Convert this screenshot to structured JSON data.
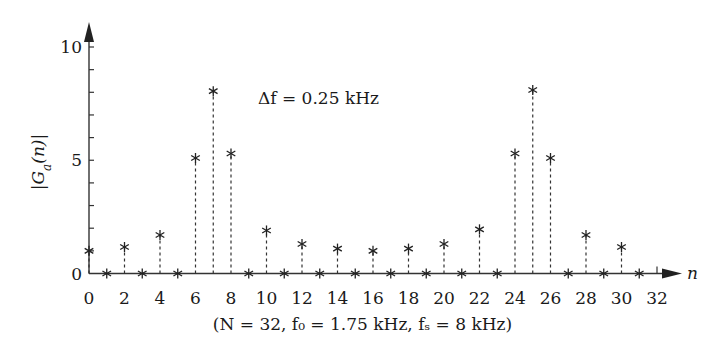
{
  "chart_data": {
    "type": "scatter",
    "style": "stem",
    "title": "",
    "xlabel": "n",
    "ylabel": "|G_a(n)|",
    "xlim": [
      0,
      32
    ],
    "ylim": [
      0,
      10
    ],
    "xticks": [
      0,
      2,
      4,
      6,
      8,
      10,
      12,
      14,
      16,
      18,
      20,
      22,
      24,
      26,
      28,
      30,
      32
    ],
    "yticks_labeled": [
      0,
      5,
      10
    ],
    "yticks_minor": [
      1,
      2,
      3,
      4,
      6,
      7,
      8,
      9
    ],
    "grid": false,
    "marker": "*",
    "x": [
      0,
      1,
      2,
      3,
      4,
      5,
      6,
      7,
      8,
      9,
      10,
      11,
      12,
      13,
      14,
      15,
      16,
      17,
      18,
      19,
      20,
      21,
      22,
      23,
      24,
      25,
      26,
      27,
      28,
      29,
      30,
      31
    ],
    "values": [
      1.0,
      0,
      1.17,
      0,
      1.7,
      0,
      5.1,
      8.05,
      5.3,
      0,
      1.9,
      0,
      1.3,
      0,
      1.1,
      0,
      1.0,
      0,
      1.1,
      0,
      1.3,
      0,
      1.95,
      0,
      5.3,
      8.1,
      5.1,
      0,
      1.7,
      0,
      1.17,
      0
    ],
    "annotations": [
      {
        "text": "Δf = 0.25 kHz",
        "x": 11,
        "y": 8
      }
    ],
    "subtitle": "(N = 32,  f₀ = 1.75 kHz,  f_s = 8 kHz)"
  },
  "labels": {
    "y_axis": "|G",
    "y_sub": "a",
    "y_rest": "(n)|",
    "x_axis": "n",
    "annotation": "Δf = 0.25 kHz",
    "params": "(N = 32,  f₀ = 1.75 kHz,  fₛ = 8 kHz)"
  }
}
